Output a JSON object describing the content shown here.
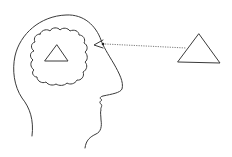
{
  "diagram": {
    "stroke_color": "#3a3a3a",
    "dotted_line_color": "#6b6b6b",
    "background": "#ffffff",
    "elements": [
      {
        "name": "head-profile",
        "type": "outline"
      },
      {
        "name": "brain-cloud",
        "type": "cloud"
      },
      {
        "name": "mental-triangle",
        "type": "triangle"
      },
      {
        "name": "eye",
        "type": "eye"
      },
      {
        "name": "line-of-sight",
        "type": "dotted-line"
      },
      {
        "name": "external-triangle",
        "type": "triangle"
      }
    ]
  }
}
